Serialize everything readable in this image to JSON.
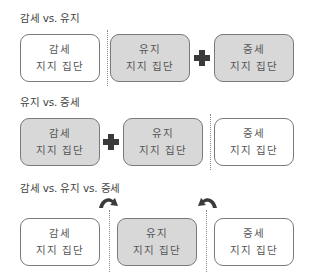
{
  "sections": [
    {
      "heading": "감세 vs. 유지",
      "boxes": [
        {
          "line1": "감세",
          "line2": "지지 집단",
          "style": "white"
        },
        {
          "line1": "유지",
          "line2": "지지 집단",
          "style": "gray"
        },
        {
          "line1": "증세",
          "line2": "지지 집단",
          "style": "gray"
        }
      ],
      "connectors": [
        "divider",
        "plus"
      ]
    },
    {
      "heading": "유지 vs. 증세",
      "boxes": [
        {
          "line1": "감세",
          "line2": "지지 집단",
          "style": "gray"
        },
        {
          "line1": "유지",
          "line2": "지지 집단",
          "style": "gray"
        },
        {
          "line1": "증세",
          "line2": "지지 집단",
          "style": "white"
        }
      ],
      "connectors": [
        "plus",
        "divider"
      ]
    },
    {
      "heading": "감세 vs. 유지 vs. 증세",
      "boxes": [
        {
          "line1": "감세",
          "line2": "지지 집단",
          "style": "white"
        },
        {
          "line1": "유지",
          "line2": "지지 집단",
          "style": "gray"
        },
        {
          "line1": "증세",
          "line2": "지지 집단",
          "style": "white"
        }
      ],
      "connectors": [
        "divider-with-arrow-right",
        "divider-with-arrow-left"
      ]
    }
  ],
  "colors": {
    "gray_fill": "#d8d8d8",
    "white_fill": "#ffffff",
    "border": "#7a7a7a",
    "icon": "#3a3a3a"
  }
}
